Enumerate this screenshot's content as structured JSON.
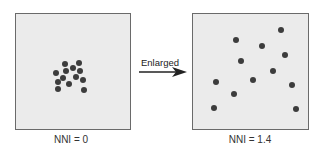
{
  "left_panel": {
    "caption": "NNI = 0",
    "points": [
      [
        65,
        64
      ],
      [
        79,
        63
      ],
      [
        73,
        68
      ],
      [
        56,
        73
      ],
      [
        66,
        71
      ],
      [
        80,
        71
      ],
      [
        63,
        78
      ],
      [
        76,
        77
      ],
      [
        83,
        80
      ],
      [
        58,
        82
      ],
      [
        69,
        84
      ],
      [
        84,
        90
      ],
      [
        58,
        89
      ]
    ]
  },
  "right_panel": {
    "caption": "NNI = 1.4",
    "points": [
      [
        281,
        30
      ],
      [
        236,
        40
      ],
      [
        262,
        46
      ],
      [
        285,
        55
      ],
      [
        241,
        61
      ],
      [
        273,
        71
      ],
      [
        216,
        82
      ],
      [
        253,
        80
      ],
      [
        292,
        85
      ],
      [
        234,
        94
      ],
      [
        214,
        108
      ],
      [
        296,
        109
      ]
    ]
  },
  "arrow": {
    "label": "Enlarged"
  }
}
